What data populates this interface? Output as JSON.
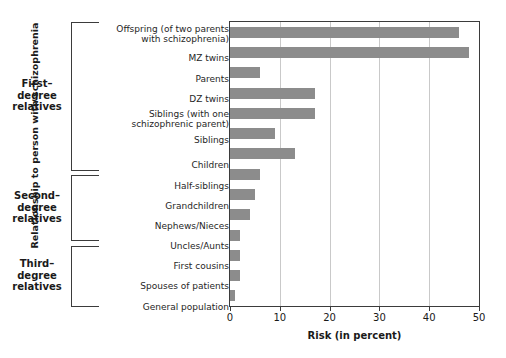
{
  "chart_data": {
    "type": "bar",
    "orientation": "horizontal",
    "title": "",
    "xlabel": "Risk (in percent)",
    "ylabel": "Relationship to person with schizophrenia",
    "xlim": [
      0,
      50
    ],
    "xticks": [
      0,
      10,
      20,
      30,
      40,
      50
    ],
    "grid": true,
    "legend": "none",
    "bar_color": "#8c8c8c",
    "categories": [
      "Offspring (of two parents with schizophrenia)",
      "MZ twins",
      "Parents",
      "DZ twins",
      "Siblings (with one schizophrenic parent)",
      "Siblings",
      "Children",
      "Half-siblings",
      "Grandchildren",
      "Nephews/Nieces",
      "Uncles/Aunts",
      "First cousins",
      "Spouses  of patients",
      "General population"
    ],
    "values": [
      46,
      48,
      6,
      17,
      17,
      9,
      13,
      6,
      5,
      4,
      2,
      2,
      2,
      1
    ],
    "groups": [
      {
        "label": "First–\ndegree\nrelatives",
        "from": 0,
        "to": 6
      },
      {
        "label": "Second–\ndegree\nrelatives",
        "from": 7,
        "to": 10
      },
      {
        "label": "Third–\ndegree\nrelatives",
        "from": 11,
        "to": 13
      }
    ]
  },
  "labels": {
    "cat_0_line1": "Offspring (of two parents",
    "cat_0_line2": "with schizophrenia)",
    "cat_1": "MZ twins",
    "cat_2": "Parents",
    "cat_3": "DZ twins",
    "cat_4_line1": "Siblings (with one",
    "cat_4_line2": "schizophrenic parent)",
    "cat_5": "Siblings",
    "cat_6": "Children",
    "cat_7": "Half-siblings",
    "cat_8": "Grandchildren",
    "cat_9": "Nephews/Nieces",
    "cat_10": "Uncles/Aunts",
    "cat_11": "First cousins",
    "cat_12": "Spouses  of patients",
    "cat_13": "General population"
  },
  "groups": {
    "g0_l1": "First–",
    "g0_l2": "degree",
    "g0_l3": "relatives",
    "g1_l1": "Second–",
    "g1_l2": "degree",
    "g1_l3": "relatives",
    "g2_l1": "Third–",
    "g2_l2": "degree",
    "g2_l3": "relatives"
  },
  "axis": {
    "x_title": "Risk (in percent)",
    "y_title": "Relationship to person with schizophrenia",
    "t0": "0",
    "t1": "10",
    "t2": "20",
    "t3": "30",
    "t4": "40",
    "t5": "50"
  }
}
